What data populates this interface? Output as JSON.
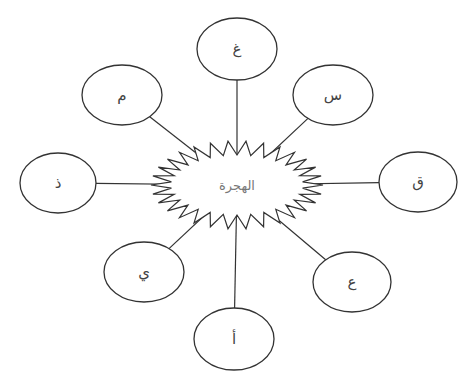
{
  "diagram": {
    "type": "mind-map",
    "colors": {
      "stroke": "#333333",
      "center_text": "#777777",
      "node_text": "#444444",
      "background": "#ffffff"
    },
    "center": {
      "label": "الهجرة",
      "shape": "starburst",
      "cx": 237,
      "cy": 185
    },
    "nodes": [
      {
        "id": "top",
        "label": "غ",
        "cx": 237,
        "cy": 49,
        "rx": 40,
        "ry": 31
      },
      {
        "id": "top-left",
        "label": "م",
        "cx": 122,
        "cy": 95,
        "rx": 40,
        "ry": 30
      },
      {
        "id": "top-right",
        "label": "س",
        "cx": 333,
        "cy": 95,
        "rx": 40,
        "ry": 30
      },
      {
        "id": "left",
        "label": "ذ",
        "cx": 58,
        "cy": 183,
        "rx": 38,
        "ry": 30
      },
      {
        "id": "right",
        "label": "ق",
        "cx": 418,
        "cy": 182,
        "rx": 39,
        "ry": 30
      },
      {
        "id": "bottom-left",
        "label": "ي",
        "cx": 144,
        "cy": 272,
        "rx": 40,
        "ry": 30
      },
      {
        "id": "bottom-right",
        "label": "ع",
        "cx": 352,
        "cy": 282,
        "rx": 39,
        "ry": 30
      },
      {
        "id": "bottom",
        "label": "أ",
        "cx": 234,
        "cy": 339,
        "rx": 40,
        "ry": 31
      }
    ]
  }
}
